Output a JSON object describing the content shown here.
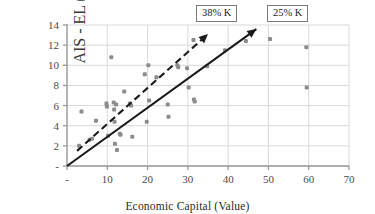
{
  "chart_data": {
    "type": "scatter",
    "title": "",
    "xlabel": "Economic Capital (Value)",
    "ylabel": "AIS - EL (Value)",
    "xlim": [
      0,
      70
    ],
    "ylim": [
      0,
      14
    ],
    "grid": true,
    "legend": "none",
    "xticks": [
      "-",
      "10",
      "20",
      "30",
      "40",
      "50",
      "60",
      "70"
    ],
    "xtick_values": [
      0,
      10,
      20,
      30,
      40,
      50,
      60,
      70
    ],
    "yticks": [
      "-",
      "2",
      "4",
      "6",
      "8",
      "10",
      "12",
      "14"
    ],
    "ytick_values": [
      0,
      2,
      4,
      6,
      8,
      10,
      12,
      14
    ],
    "points": [
      {
        "x": 3.0,
        "y": 2.0
      },
      {
        "x": 3.6,
        "y": 5.4
      },
      {
        "x": 5.6,
        "y": 2.6
      },
      {
        "x": 6.2,
        "y": 2.7
      },
      {
        "x": 7.2,
        "y": 4.5
      },
      {
        "x": 9.8,
        "y": 6.2
      },
      {
        "x": 9.9,
        "y": 5.9
      },
      {
        "x": 10.2,
        "y": 3.0
      },
      {
        "x": 11.0,
        "y": 10.8
      },
      {
        "x": 11.6,
        "y": 6.3
      },
      {
        "x": 11.7,
        "y": 5.6
      },
      {
        "x": 11.8,
        "y": 4.4
      },
      {
        "x": 11.9,
        "y": 2.2
      },
      {
        "x": 12.2,
        "y": 6.1
      },
      {
        "x": 12.4,
        "y": 1.6
      },
      {
        "x": 13.1,
        "y": 3.2
      },
      {
        "x": 13.3,
        "y": 3.1
      },
      {
        "x": 14.2,
        "y": 7.4
      },
      {
        "x": 15.6,
        "y": 6.2
      },
      {
        "x": 15.9,
        "y": 6.0
      },
      {
        "x": 16.2,
        "y": 2.9
      },
      {
        "x": 19.3,
        "y": 9.1
      },
      {
        "x": 19.8,
        "y": 4.4
      },
      {
        "x": 20.2,
        "y": 10.0
      },
      {
        "x": 20.4,
        "y": 6.5
      },
      {
        "x": 22.2,
        "y": 8.8
      },
      {
        "x": 25.0,
        "y": 6.1
      },
      {
        "x": 25.2,
        "y": 4.9
      },
      {
        "x": 27.4,
        "y": 10.0
      },
      {
        "x": 27.6,
        "y": 9.8
      },
      {
        "x": 29.8,
        "y": 9.7
      },
      {
        "x": 30.2,
        "y": 7.8
      },
      {
        "x": 31.4,
        "y": 12.5
      },
      {
        "x": 31.5,
        "y": 6.6
      },
      {
        "x": 31.7,
        "y": 6.4
      },
      {
        "x": 34.8,
        "y": 9.9
      },
      {
        "x": 39.2,
        "y": 11.5
      },
      {
        "x": 44.4,
        "y": 12.4
      },
      {
        "x": 50.4,
        "y": 12.6
      },
      {
        "x": 59.4,
        "y": 11.8
      },
      {
        "x": 59.5,
        "y": 7.8
      }
    ],
    "trend_lines": [
      {
        "name": "solid-trend",
        "label": "25% K",
        "style": "solid",
        "arrow": true,
        "x0": 0.0,
        "y0": 0.0,
        "x1": 47.0,
        "y1": 13.6
      },
      {
        "name": "dashed-trend",
        "label": "38% K",
        "style": "dashed",
        "arrow": true,
        "x0": 2.5,
        "y0": 1.5,
        "x1": 35.0,
        "y1": 13.1
      }
    ],
    "annotations": [
      {
        "name": "callout-38",
        "text": "38% K"
      },
      {
        "name": "callout-25",
        "text": "25% K"
      }
    ],
    "colors": {
      "point": "#8c8c8c",
      "line": "#1a1a1a",
      "grid": "#d9d9d9",
      "axis": "#9a9a9a",
      "text": "#2b2b2b"
    }
  }
}
